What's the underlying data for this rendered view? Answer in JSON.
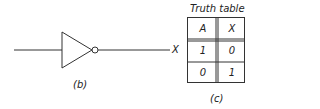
{
  "diagram": {
    "gate": "NOT",
    "output_label": "X",
    "caption_b": "(b)",
    "caption_c": "(c)"
  },
  "truth_table": {
    "title": "Truth table",
    "headers": [
      "A",
      "X"
    ],
    "rows": [
      [
        "1",
        "0"
      ],
      [
        "0",
        "1"
      ]
    ]
  },
  "colors": {
    "line": "#333333",
    "background": "#ffffff"
  }
}
